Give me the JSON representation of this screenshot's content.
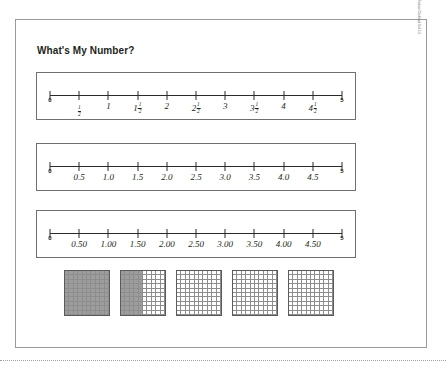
{
  "page": {
    "title": "What's My Number?",
    "margin_credit": "Math & Science Chartbook Unit 5.6"
  },
  "number_lines": [
    {
      "name": "fractions",
      "start_label": "0",
      "end_label": "5",
      "labels": [
        {
          "value": 0,
          "text": "0",
          "type": "endpoint"
        },
        {
          "value": 0.5,
          "whole": "",
          "num": "1",
          "den": "2",
          "type": "fraction"
        },
        {
          "value": 1,
          "text": "1",
          "type": "plain"
        },
        {
          "value": 1.5,
          "whole": "1",
          "num": "1",
          "den": "2",
          "type": "fraction"
        },
        {
          "value": 2,
          "text": "2",
          "type": "plain"
        },
        {
          "value": 2.5,
          "whole": "2",
          "num": "1",
          "den": "2",
          "type": "fraction"
        },
        {
          "value": 3,
          "text": "3",
          "type": "plain"
        },
        {
          "value": 3.5,
          "whole": "3",
          "num": "1",
          "den": "2",
          "type": "fraction"
        },
        {
          "value": 4,
          "text": "4",
          "type": "plain"
        },
        {
          "value": 4.5,
          "whole": "4",
          "num": "1",
          "den": "2",
          "type": "fraction"
        },
        {
          "value": 5,
          "text": "5",
          "type": "endpoint"
        }
      ]
    },
    {
      "name": "decimals-tenths",
      "start_label": "0",
      "end_label": "5",
      "labels": [
        {
          "value": 0,
          "text": "0",
          "type": "endpoint"
        },
        {
          "value": 0.5,
          "text": "0.5",
          "type": "plain"
        },
        {
          "value": 1,
          "text": "1.0",
          "type": "plain"
        },
        {
          "value": 1.5,
          "text": "1.5",
          "type": "plain"
        },
        {
          "value": 2,
          "text": "2.0",
          "type": "plain"
        },
        {
          "value": 2.5,
          "text": "2.5",
          "type": "plain"
        },
        {
          "value": 3,
          "text": "3.0",
          "type": "plain"
        },
        {
          "value": 3.5,
          "text": "3.5",
          "type": "plain"
        },
        {
          "value": 4,
          "text": "4.0",
          "type": "plain"
        },
        {
          "value": 4.5,
          "text": "4.5",
          "type": "plain"
        },
        {
          "value": 5,
          "text": "5",
          "type": "endpoint"
        }
      ]
    },
    {
      "name": "decimals-hundredths",
      "start_label": "0",
      "end_label": "5",
      "labels": [
        {
          "value": 0,
          "text": "0",
          "type": "endpoint"
        },
        {
          "value": 0.5,
          "text": "0.50",
          "type": "plain"
        },
        {
          "value": 1,
          "text": "1.00",
          "type": "plain"
        },
        {
          "value": 1.5,
          "text": "1.50",
          "type": "plain"
        },
        {
          "value": 2,
          "text": "2.00",
          "type": "plain"
        },
        {
          "value": 2.5,
          "text": "2.50",
          "type": "plain"
        },
        {
          "value": 3,
          "text": "3.00",
          "type": "plain"
        },
        {
          "value": 3.5,
          "text": "3.50",
          "type": "plain"
        },
        {
          "value": 4,
          "text": "4.00",
          "type": "plain"
        },
        {
          "value": 4.5,
          "text": "4.50",
          "type": "plain"
        },
        {
          "value": 5,
          "text": "5",
          "type": "endpoint"
        }
      ]
    }
  ],
  "hundred_grids": {
    "rows": 10,
    "columns": 10,
    "shade_color": "#9d9d9d",
    "grids": [
      {
        "label": "grid-1",
        "shaded_cells": 100,
        "shaded_columns": 10
      },
      {
        "label": "grid-2",
        "shaded_cells": 50,
        "shaded_columns": 5
      },
      {
        "label": "grid-3",
        "shaded_cells": 0,
        "shaded_columns": 0
      },
      {
        "label": "grid-4",
        "shaded_cells": 0,
        "shaded_columns": 0
      },
      {
        "label": "grid-5",
        "shaded_cells": 0,
        "shaded_columns": 0
      }
    ]
  }
}
